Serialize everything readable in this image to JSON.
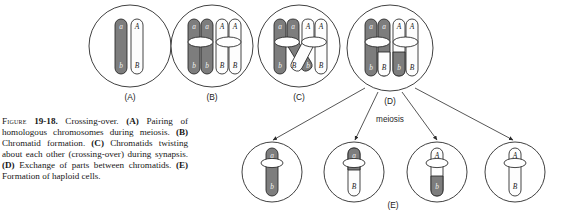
{
  "figure": {
    "number": "19-18",
    "figure_word": "Figure",
    "title": "Crossing-over.",
    "caption_parts": [
      {
        "marker": "(A)",
        "text": "Pairing of homologous chromosomes during meiosis."
      },
      {
        "marker": "(B)",
        "text": "Chromatid formation."
      },
      {
        "marker": "(C)",
        "text": "Chromatids twisting about each other (crossing-over) during synapsis."
      },
      {
        "marker": "(D)",
        "text": "Exchange of parts between chromatids."
      },
      {
        "marker": "(E)",
        "text": "Formation of haploid cells."
      }
    ],
    "caption_full": "Figure 19-18. Crossing-over. (A) Pairing of homologous chromosomes during meiosis. (B) Chromatid formation. (C) Chromatids twisting about each other (crossing-over) during synapsis. (D) Exchange of parts between chromatids. (E) Formation of haploid cells."
  },
  "process_label": "meiosis",
  "colors": {
    "dark_chromosome": "#7d7d7d",
    "light_chromosome": "#fdfdfd",
    "outline": "#232323",
    "cell_membrane": "#2b2b2b",
    "background": "#ffffff"
  },
  "panels": [
    {
      "id": "A",
      "label": "(A)",
      "description": "Pairing of homologous chromosomes during meiosis",
      "chromatid_count": 2,
      "chromatids": [
        {
          "shade": "dark",
          "top_allele": "a",
          "bottom_allele": "b",
          "top_shade": "dark",
          "bottom_shade": "dark"
        },
        {
          "shade": "light",
          "top_allele": "A",
          "bottom_allele": "B",
          "top_shade": "light",
          "bottom_shade": "light"
        }
      ]
    },
    {
      "id": "B",
      "label": "(B)",
      "description": "Chromatid formation",
      "chromatid_count": 4,
      "chromatids": [
        {
          "shade": "dark",
          "top_allele": "a",
          "bottom_allele": "b",
          "top_shade": "dark",
          "bottom_shade": "dark"
        },
        {
          "shade": "dark",
          "top_allele": "a",
          "bottom_allele": "b",
          "top_shade": "dark",
          "bottom_shade": "dark"
        },
        {
          "shade": "light",
          "top_allele": "A",
          "bottom_allele": "B",
          "top_shade": "light",
          "bottom_shade": "light"
        },
        {
          "shade": "light",
          "top_allele": "A",
          "bottom_allele": "B",
          "top_shade": "light",
          "bottom_shade": "light"
        }
      ]
    },
    {
      "id": "C",
      "label": "(C)",
      "description": "Chromatids twisting about each other (crossing-over) during synapsis",
      "chromatid_count": 4,
      "crossover": true,
      "chromatids": [
        {
          "shade": "dark",
          "top_allele": "a",
          "bottom_allele": "b",
          "top_shade": "dark",
          "bottom_shade": "dark"
        },
        {
          "shade": "dark",
          "top_allele": "a",
          "bottom_allele": "B",
          "top_shade": "dark",
          "bottom_shade": "light"
        },
        {
          "shade": "light",
          "top_allele": "A",
          "bottom_allele": "b",
          "top_shade": "light",
          "bottom_shade": "dark"
        },
        {
          "shade": "light",
          "top_allele": "A",
          "bottom_allele": "B",
          "top_shade": "light",
          "bottom_shade": "light"
        }
      ]
    },
    {
      "id": "D",
      "label": "(D)",
      "description": "Exchange of parts between chromatids",
      "chromatid_count": 4,
      "chromatids": [
        {
          "shade": "dark",
          "top_allele": "a",
          "bottom_allele": "b",
          "top_shade": "dark",
          "bottom_shade": "dark"
        },
        {
          "shade": "dark",
          "top_allele": "a",
          "bottom_allele": "B",
          "top_shade": "dark",
          "bottom_shade": "light"
        },
        {
          "shade": "light",
          "top_allele": "A",
          "bottom_allele": "b",
          "top_shade": "light",
          "bottom_shade": "dark"
        },
        {
          "shade": "light",
          "top_allele": "A",
          "bottom_allele": "B",
          "top_shade": "light",
          "bottom_shade": "light"
        }
      ]
    }
  ],
  "haploid_row": {
    "id": "E",
    "label": "(E)",
    "description": "Formation of haploid cells",
    "cells": [
      {
        "index": 1,
        "top_allele": "a",
        "bottom_allele": "b",
        "top_shade": "dark",
        "bottom_shade": "dark",
        "type": "parental"
      },
      {
        "index": 2,
        "top_allele": "a",
        "bottom_allele": "B",
        "top_shade": "dark",
        "bottom_shade": "light",
        "type": "recombinant"
      },
      {
        "index": 3,
        "top_allele": "A",
        "bottom_allele": "b",
        "top_shade": "light",
        "bottom_shade": "dark",
        "type": "recombinant"
      },
      {
        "index": 4,
        "top_allele": "A",
        "bottom_allele": "B",
        "top_shade": "light",
        "bottom_shade": "light",
        "type": "parental"
      }
    ]
  }
}
